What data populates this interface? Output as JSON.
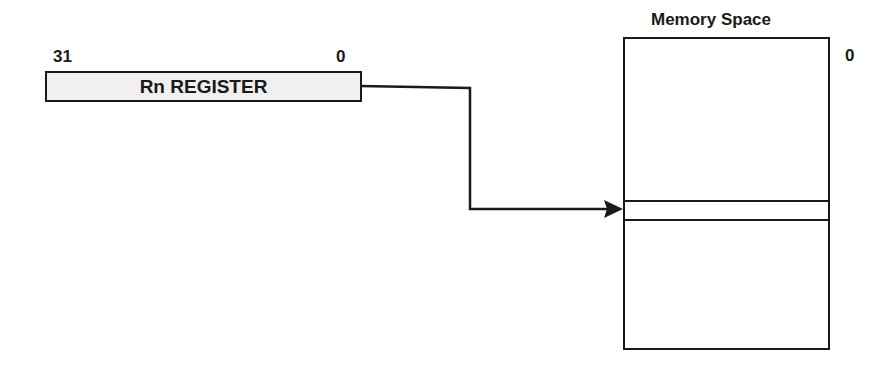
{
  "diagram": {
    "register": {
      "label": "Rn REGISTER",
      "msb_label": "31",
      "lsb_label": "0",
      "fill": "#f0f0f0"
    },
    "memory": {
      "title": "Memory Space",
      "address_label": "0"
    },
    "connector": {
      "description": "Arrow from Rn register to addressed memory location",
      "color": "#1a1a1a"
    }
  }
}
